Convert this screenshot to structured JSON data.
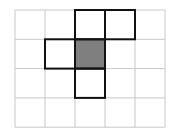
{
  "diagram": {
    "type": "grid-figure",
    "rows": 4,
    "cols": 5,
    "origin": {
      "x": 15,
      "y": 10
    },
    "cell": {
      "w": 30,
      "h": 29.3
    },
    "grid_color": "#c8c8c8",
    "outline_color": "#111111",
    "shade_color": "#7f7f7f",
    "outlined_cells": [
      {
        "row": 0,
        "col": 2
      },
      {
        "row": 0,
        "col": 3
      },
      {
        "row": 1,
        "col": 1
      },
      {
        "row": 1,
        "col": 2,
        "shaded": true
      },
      {
        "row": 2,
        "col": 2
      }
    ]
  }
}
